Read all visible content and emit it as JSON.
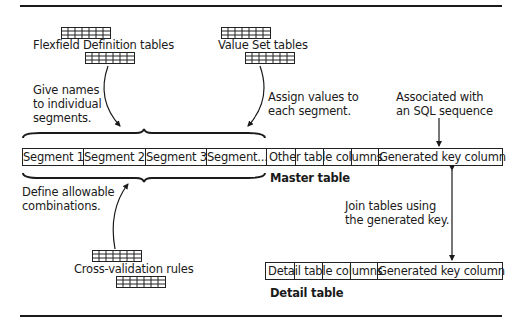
{
  "diagram": {
    "sources": {
      "flexfield_definition": {
        "label": "Flexfield Definition tables",
        "note": [
          "Give names",
          "to individual",
          "segments."
        ]
      },
      "value_set": {
        "label": "Value Set tables",
        "note": [
          "Assign values to",
          "each segment."
        ]
      },
      "cross_validation": {
        "label": "Cross-validation rules",
        "note": [
          "Define allowable",
          "combinations."
        ]
      }
    },
    "sequence_note": [
      "Associated with",
      "an SQL sequence"
    ],
    "join_note": [
      "Join tables using",
      "the generated key."
    ],
    "master_table": {
      "title": "Master table",
      "segments": [
        "Segment 1",
        "Segment 2",
        "Segment 3",
        "Segment..."
      ],
      "other_columns": "Other table columns",
      "key_column": "Generated key column"
    },
    "detail_table": {
      "title": "Detail table",
      "other_columns": "Detail table columns",
      "key_column": "Generated key column"
    },
    "colors": {
      "ink": "#1a1a1a",
      "background": "#ffffff"
    }
  }
}
